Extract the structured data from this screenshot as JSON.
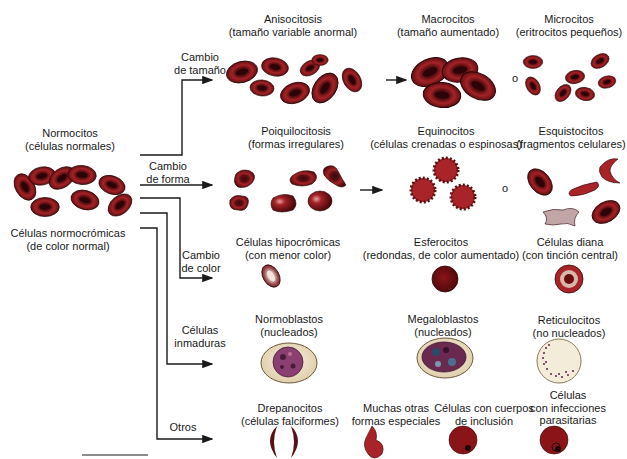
{
  "source": {
    "name": "Normocitos",
    "subtitle": "(células normales)",
    "caption_line1": "Células normocrómicas",
    "caption_line2": "(de color normal)"
  },
  "branches": [
    {
      "id": "size",
      "line1": "Cambio",
      "line2": "de tamaño"
    },
    {
      "id": "shape",
      "line1": "Cambio",
      "line2": "de forma"
    },
    {
      "id": "color",
      "line1": "Cambio",
      "line2": "de color"
    },
    {
      "id": "immature",
      "line1": "Células",
      "line2": "inmaduras"
    },
    {
      "id": "other",
      "line1": "Otros",
      "line2": ""
    }
  ],
  "rows": {
    "size": [
      {
        "name": "Anisocitosis",
        "desc": "(tamaño variable anormal)"
      },
      {
        "name": "Macrocitos",
        "desc": "(tamaño aumentado)"
      },
      {
        "name": "Microcitos",
        "desc": "(eritrocitos pequeños)"
      }
    ],
    "shape": [
      {
        "name": "Poiquilocitosis",
        "desc": "(formas irregulares)"
      },
      {
        "name": "Equinocitos",
        "desc": "(células crenadas o espinosas)"
      },
      {
        "name": "Esquistocitos",
        "desc": "(fragmentos celulares)"
      }
    ],
    "color": [
      {
        "name": "Células hipocrómicas",
        "desc": "(con menor color)"
      },
      {
        "name": "Esferocitos",
        "desc": "(redondas, de color aumentado)"
      },
      {
        "name": "Células diana",
        "desc": "(con tinción central)"
      }
    ],
    "immature": [
      {
        "name": "Normoblastos",
        "desc": "(nucleados)"
      },
      {
        "name": "Megaloblastos",
        "desc": "(nucleados)"
      },
      {
        "name": "Reticulocitos",
        "desc": "(no nucleados)"
      }
    ],
    "other": [
      {
        "name": "Drepanocitos",
        "desc": "(células falciformes)"
      },
      {
        "name": "Muchas otras",
        "desc": "formas especiales"
      },
      {
        "name": "Células con cuerpos",
        "desc": "de inclusión"
      },
      {
        "name": "Células",
        "desc": "con infecciones",
        "desc2": "parasitarias"
      }
    ]
  },
  "connectors": {
    "or_label": "o"
  },
  "colors": {
    "cell_dark": "#5a0f12",
    "cell_mid": "#9a1e22",
    "cell_light": "#c2383a",
    "pale_cell": "#e8d7b8",
    "nucleus": "#7a2a6a",
    "line": "#1a1a1a"
  }
}
